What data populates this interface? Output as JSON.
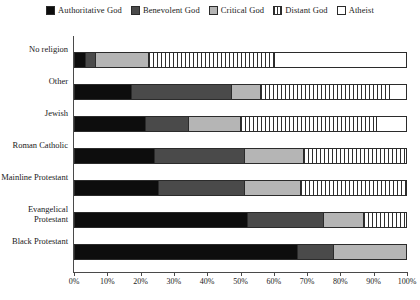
{
  "chart_data": {
    "type": "bar",
    "orientation": "horizontal",
    "stacked": true,
    "stack_total": 100,
    "title": "",
    "subtitle": "",
    "xlabel": "",
    "ylabel": "",
    "xlim": [
      0,
      100
    ],
    "xticks": [
      "0%",
      "10%",
      "20%",
      "30%",
      "40%",
      "50%",
      "60%",
      "70%",
      "80%",
      "90%",
      "100%"
    ],
    "xtick_values": [
      0,
      10,
      20,
      30,
      40,
      50,
      60,
      70,
      80,
      90,
      100
    ],
    "grid": false,
    "legend_position": "top",
    "categories": [
      "No religion",
      "Other",
      "Jewish",
      "Roman Catholic",
      "Mainline Protestant",
      "Evangelical\nProtestant",
      "Black Protestant"
    ],
    "series": [
      {
        "name": "Authoritative God",
        "color": "#0d0d0d",
        "pattern": "solid-black",
        "values": [
          3,
          17,
          21,
          24,
          25,
          52,
          67
        ]
      },
      {
        "name": "Benevolent God",
        "color": "#4a4a4a",
        "pattern": "solid-dark-gray",
        "values": [
          3,
          30,
          13,
          27,
          26,
          23,
          11
        ]
      },
      {
        "name": "Critical God",
        "color": "#b5b5b5",
        "pattern": "solid-light-gray",
        "values": [
          16,
          9,
          16,
          18,
          17,
          12,
          22
        ]
      },
      {
        "name": "Distant God",
        "color": "#ffffff",
        "pattern": "vertical-stripes",
        "values": [
          38,
          39,
          41,
          31,
          32,
          13,
          0
        ]
      },
      {
        "name": "Atheist",
        "color": "#ffffff",
        "pattern": "empty-white",
        "values": [
          40,
          5,
          9,
          0,
          0,
          0,
          0
        ]
      }
    ]
  }
}
